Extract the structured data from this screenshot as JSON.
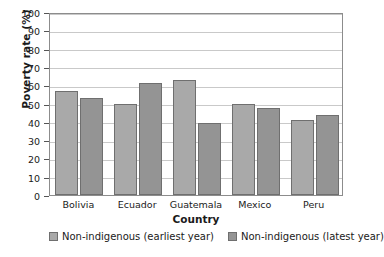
{
  "chart_data": {
    "type": "bar",
    "title": "",
    "xlabel": "Country",
    "ylabel": "Poverty rate (%)",
    "categories": [
      "Bolivia",
      "Ecuador",
      "Guatemala",
      "Mexico",
      "Peru"
    ],
    "series": [
      {
        "name": "Non-indigenous (earliest year)",
        "color": "#a9a9a9",
        "values": [
          57,
          50,
          63,
          50,
          41
        ]
      },
      {
        "name": "Non-indigenous (latest year)",
        "color": "#949494",
        "values": [
          53,
          61,
          39.5,
          47.5,
          43.5
        ]
      }
    ],
    "ylim": [
      0,
      100
    ],
    "yticks": [
      0,
      10,
      20,
      30,
      40,
      50,
      60,
      70,
      80,
      90,
      100
    ],
    "ytick_labels": [
      "0",
      "10",
      "20",
      "30",
      "40",
      "50",
      "60",
      "70",
      "80",
      "90",
      "100"
    ],
    "grid": true,
    "legend_position": "bottom"
  }
}
